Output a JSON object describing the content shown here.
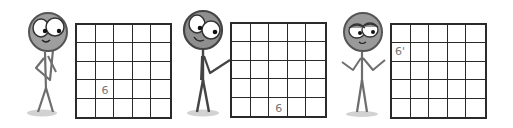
{
  "comic": {
    "panel_count": 3,
    "colors": {
      "ink": "#2a2a2a",
      "face_fill": "#9e9e9e",
      "body_ink": "#6e6e6e",
      "pencil": "#777777",
      "shadow": "#cfcfcf",
      "background": "#ffffff"
    },
    "panels": [
      {
        "figure": {
          "pose": "hand-on-chin-thinking",
          "expression": "wide-eyed-smile"
        },
        "grid": {
          "rows": 5,
          "cols": 5,
          "left": 75,
          "top": 23,
          "size": 97,
          "mark": {
            "row": 3,
            "col": 1,
            "text": "6"
          }
        }
      },
      {
        "figure": {
          "pose": "arm-pointing-at-grid",
          "expression": "wide-eyed-smile"
        },
        "grid": {
          "rows": 5,
          "cols": 5,
          "left": 230,
          "top": 22,
          "size": 97,
          "mark": {
            "row": 4,
            "col": 2,
            "text": "6"
          }
        }
      },
      {
        "figure": {
          "pose": "shrugging-both-arms-out",
          "expression": "half-lidded-smirk"
        },
        "grid": {
          "rows": 5,
          "cols": 5,
          "left": 390,
          "top": 23,
          "size": 97,
          "mark": {
            "row": 1,
            "col": 0,
            "text": "6'"
          }
        }
      }
    ]
  }
}
